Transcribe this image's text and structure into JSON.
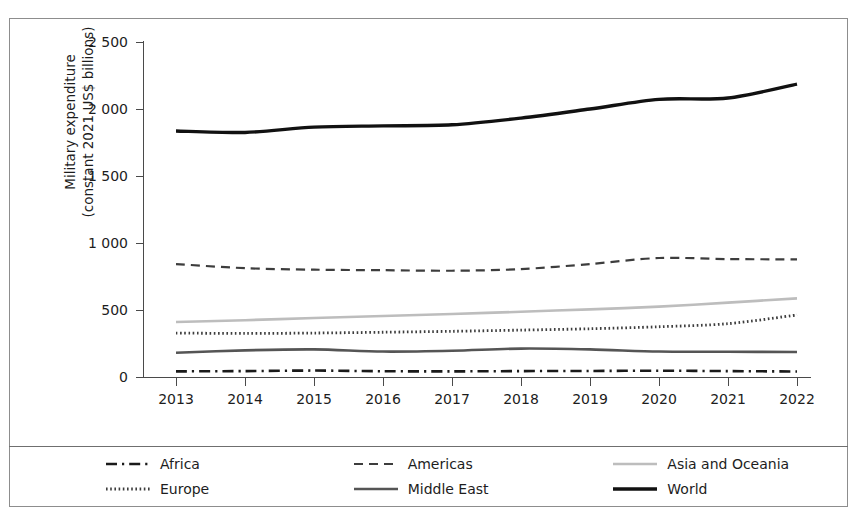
{
  "chart_data": {
    "type": "line",
    "title": "",
    "xlabel": "",
    "ylabel": "Military expenditure\n(constant 2021 US$ billions)",
    "x": [
      2013,
      2014,
      2015,
      2016,
      2017,
      2018,
      2019,
      2020,
      2021,
      2022
    ],
    "xtick_labels": [
      "2013",
      "2014",
      "2015",
      "2016",
      "2017",
      "2018",
      "2019",
      "2020",
      "2021",
      "2022"
    ],
    "ytick_labels": [
      "0",
      "500",
      "1 000",
      "1 500",
      "2 000",
      "2 500"
    ],
    "ytick_values": [
      0,
      500,
      1000,
      1500,
      2000,
      2500
    ],
    "ylim": [
      0,
      2500
    ],
    "grid": false,
    "legend_position": "below-plot",
    "series": [
      {
        "name": "Africa",
        "style": "dashdot",
        "color": "#1a1a1a",
        "width": 2.6,
        "values": [
          42,
          44,
          48,
          43,
          42,
          44,
          45,
          47,
          44,
          41
        ]
      },
      {
        "name": "Americas",
        "style": "dashed",
        "color": "#3d3d3d",
        "width": 2.2,
        "values": [
          843,
          812,
          801,
          797,
          793,
          805,
          843,
          888,
          880,
          878
        ]
      },
      {
        "name": "Asia and Oceania",
        "style": "solid",
        "color": "#bdbdbd",
        "width": 2.6,
        "values": [
          410,
          424,
          440,
          455,
          470,
          487,
          505,
          525,
          555,
          587
        ]
      },
      {
        "name": "Europe",
        "style": "dotted",
        "color": "#3d3d3d",
        "width": 2.8,
        "values": [
          328,
          325,
          328,
          334,
          341,
          350,
          360,
          375,
          398,
          463
        ]
      },
      {
        "name": "Middle East",
        "style": "solid",
        "color": "#555555",
        "width": 2.6,
        "values": [
          181,
          199,
          206,
          190,
          196,
          212,
          206,
          190,
          188,
          187
        ]
      },
      {
        "name": "World",
        "style": "solid",
        "color": "#111111",
        "width": 3.4,
        "values": [
          1836,
          1825,
          1865,
          1874,
          1882,
          1932,
          2000,
          2072,
          2082,
          2186
        ]
      }
    ]
  },
  "legend": {
    "items": [
      {
        "label": "Africa",
        "sample": "dashdot-line-sample"
      },
      {
        "label": "Americas",
        "sample": "dashed-line-sample"
      },
      {
        "label": "Asia and Oceania",
        "sample": "light-solid-line-sample"
      },
      {
        "label": "Europe",
        "sample": "dotted-line-sample"
      },
      {
        "label": "Middle East",
        "sample": "gray-solid-line-sample"
      },
      {
        "label": "World",
        "sample": "bold-solid-line-sample"
      }
    ]
  },
  "colors": {
    "frame": "#8d8d8d",
    "axis": "#4a4a4a",
    "text": "#1d1d1d",
    "background": "#ffffff"
  }
}
